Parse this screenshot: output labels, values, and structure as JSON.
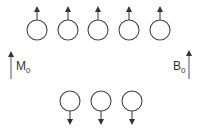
{
  "diagram": {
    "top_row": {
      "count": 5,
      "spin": "up",
      "centers_x": [
        37,
        68,
        98,
        129,
        160
      ],
      "center_y": 30
    },
    "bottom_row": {
      "count": 3,
      "spin": "down",
      "centers_x": [
        70,
        101,
        132
      ],
      "center_y": 101
    },
    "circle_radius": 10,
    "stroke_color": "#444444",
    "labels": {
      "magnetization": {
        "main": "M",
        "sub": "0"
      },
      "field": {
        "main": "B",
        "sub": "0"
      }
    }
  }
}
